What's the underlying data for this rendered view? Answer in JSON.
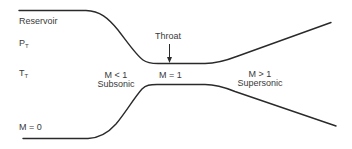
{
  "diagram": {
    "type": "converging-diverging nozzle",
    "labels": {
      "reservoir": "Reservoir",
      "pressure_symbol": "P",
      "pressure_subscript": "T",
      "temperature_symbol": "T",
      "temperature_subscript": "T",
      "inlet_mach": "M = 0",
      "throat": "Throat",
      "subsonic_mach": "M < 1",
      "subsonic": "Subsonic",
      "throat_mach": "M = 1",
      "supersonic_mach": "M > 1",
      "supersonic": "Supersonic"
    },
    "regions": [
      {
        "name": "Reservoir",
        "mach": "M = 0"
      },
      {
        "name": "Subsonic",
        "mach": "M < 1"
      },
      {
        "name": "Throat",
        "mach": "M = 1"
      },
      {
        "name": "Supersonic",
        "mach": "M > 1"
      }
    ],
    "stroke_color": "#2a2a2a",
    "text_color": "#3a3a3a"
  }
}
